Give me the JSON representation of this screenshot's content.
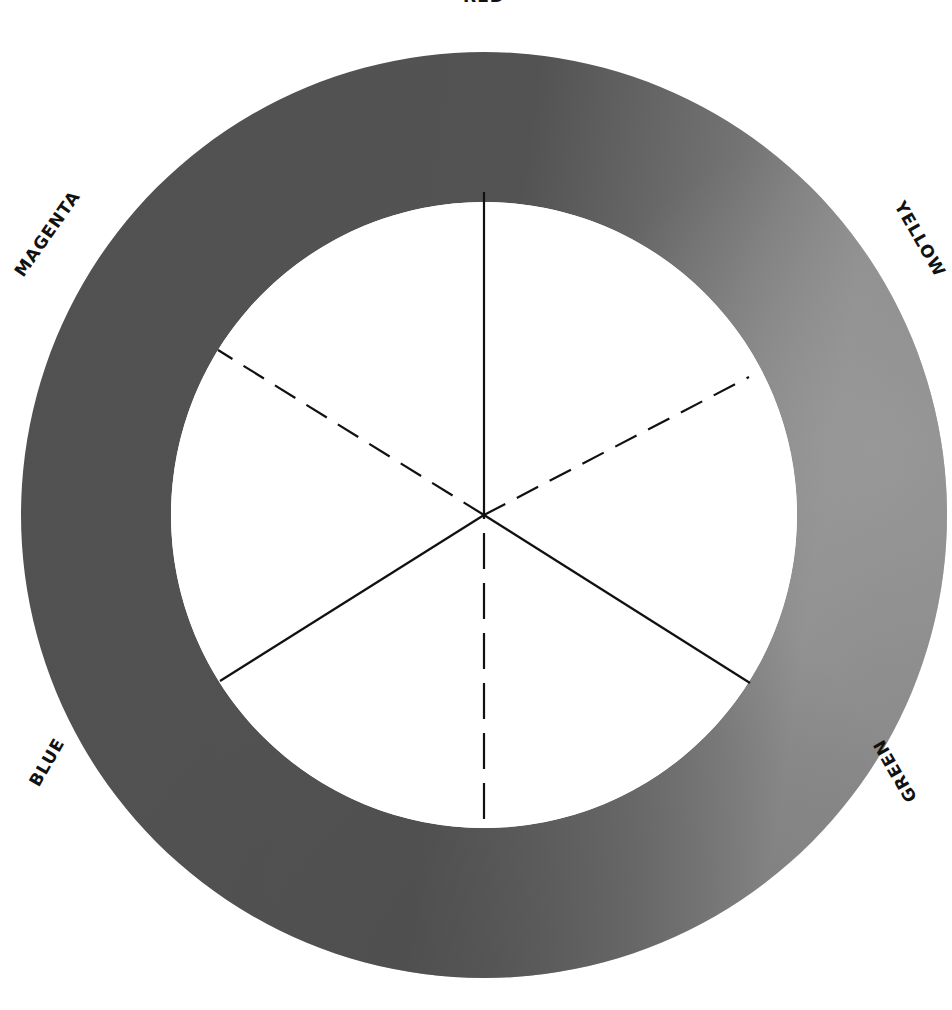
{
  "diagram": {
    "type": "color-wheel",
    "center": {
      "x": 484,
      "y": 515
    },
    "outer_radius": 463,
    "inner_radius": 313,
    "ring_color_dark": "#4f4f4f",
    "ring_color_light": "#8c8c8c",
    "line_color": "#111111",
    "labels": {
      "red": "RED",
      "yellow": "YELLOW",
      "green": "GREEN",
      "blue": "BLUE",
      "magenta": "MAGENTA"
    },
    "spokes": [
      {
        "direction": "red",
        "style": "solid"
      },
      {
        "direction": "green",
        "style": "solid"
      },
      {
        "direction": "blue",
        "style": "solid"
      },
      {
        "direction": "yellow",
        "style": "dashed"
      },
      {
        "direction": "magenta",
        "style": "dashed"
      },
      {
        "direction": "cyan",
        "style": "dashed"
      }
    ]
  }
}
